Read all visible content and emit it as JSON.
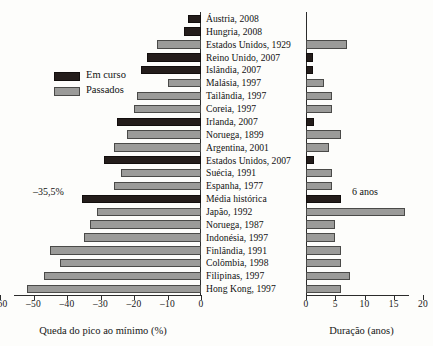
{
  "chart_data": {
    "type": "bar",
    "title": "",
    "orientation": "horizontal",
    "panels": [
      {
        "id": "left",
        "xlabel": "Queda do pico ao mínimo (%)",
        "xlim": [
          -60,
          0
        ],
        "xticks": [
          -60,
          -50,
          -40,
          -30,
          -20,
          -10,
          0
        ],
        "xticklabels": [
          "–60",
          "–50",
          "–40",
          "–30",
          "–20",
          "–10",
          "0"
        ],
        "grid": false,
        "annotation": "–35,5%"
      },
      {
        "id": "right",
        "xlabel": "Duração (anos)",
        "xlim": [
          0,
          20
        ],
        "xticks": [
          0,
          5,
          10,
          15,
          20
        ],
        "xticklabels": [
          "0",
          "5",
          "10",
          "15",
          "20"
        ],
        "grid": false,
        "annotation": "6 anos"
      }
    ],
    "legend": {
      "position": "upper-left",
      "entries": [
        {
          "label": "Em curso",
          "color": "#241d1b",
          "key": "ongoing"
        },
        {
          "label": "Passados",
          "color": "#9b9b99",
          "key": "past"
        }
      ]
    },
    "categories": [
      "Áustria, 2008",
      "Hungria, 2008",
      "Estados Unidos, 1929",
      "Reino Unido, 2007",
      "Islândia, 2007",
      "Malásia, 1997",
      "Tailândia, 1997",
      "Coreia, 1997",
      "Irlanda, 2007",
      "Noruega, 1899",
      "Argentina, 2001",
      "Estados Unidos, 2007",
      "Suécia, 1991",
      "Espanha, 1977",
      "Média histórica",
      "Japão, 1992",
      "Noruega, 1987",
      "Indonésia, 1997",
      "Finlândia, 1991",
      "Colômbia, 1998",
      "Filipinas, 1997",
      "Hong Kong, 1997"
    ],
    "series": [
      {
        "name": "Queda do pico ao mínimo (%)",
        "panel": "left",
        "unit": "%",
        "values": [
          -4,
          -5,
          -13,
          -16,
          -18,
          -10,
          -19,
          -20,
          -25,
          -22,
          -26,
          -29,
          -24,
          -26,
          -35.5,
          -31,
          -33,
          -35,
          -45,
          -42,
          -47,
          -52
        ]
      },
      {
        "name": "Duração (anos)",
        "panel": "right",
        "unit": "anos",
        "values": [
          null,
          null,
          7,
          1.2,
          1.2,
          3,
          4.5,
          4.5,
          1.3,
          6,
          4,
          1.3,
          4.5,
          4.5,
          6,
          17,
          5,
          5,
          6,
          6,
          7.5,
          6
        ]
      }
    ],
    "status": [
      "ongoing",
      "ongoing",
      "past",
      "ongoing",
      "ongoing",
      "past",
      "past",
      "past",
      "ongoing",
      "past",
      "past",
      "ongoing",
      "past",
      "past",
      "ongoing",
      "past",
      "past",
      "past",
      "past",
      "past",
      "past",
      "past"
    ]
  }
}
